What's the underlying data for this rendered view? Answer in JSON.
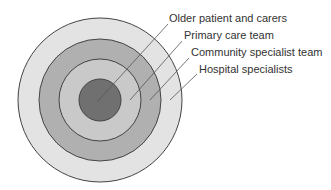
{
  "diagram": {
    "type": "concentric-circles",
    "center": [
      100,
      100
    ],
    "layers": [
      {
        "name": "Hospital specialists",
        "radius": 82,
        "fill": "#e3e3e3"
      },
      {
        "name": "Community specialist team",
        "radius": 61,
        "fill": "#b0b0b0"
      },
      {
        "name": "Primary care team",
        "radius": 41,
        "fill": "#c9c9c9"
      },
      {
        "name": "Older patient and carers",
        "radius": 21,
        "fill": "#707070"
      }
    ],
    "stroke": "#444444"
  },
  "labels": [
    {
      "text": "Older patient and carers"
    },
    {
      "text": "Primary care team"
    },
    {
      "text": "Community specialist team"
    },
    {
      "text": "Hospital specialists"
    }
  ]
}
